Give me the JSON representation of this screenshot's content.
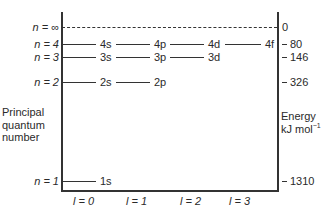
{
  "diagram": {
    "title": "",
    "left_axis_label": [
      "Principal",
      "quantum",
      "number"
    ],
    "right_axis_label": {
      "line1": "Energy",
      "line2": "kJ mol",
      "sup": "−1"
    },
    "levels": [
      {
        "n_label": "n = ∞",
        "energy": "0",
        "style": "dashed"
      },
      {
        "n_label": "n = 4",
        "energy": "80",
        "orbitals": [
          "4s",
          "4p",
          "4d",
          "4f"
        ]
      },
      {
        "n_label": "n = 3",
        "energy": "146",
        "orbitals": [
          "3s",
          "3p",
          "3d"
        ]
      },
      {
        "n_label": "n = 2",
        "energy": "326",
        "orbitals": [
          "2s",
          "2p"
        ]
      },
      {
        "n_label": "n = 1",
        "energy": "1310",
        "orbitals": [
          "1s"
        ]
      }
    ],
    "x_labels": [
      "l = 0",
      "l = 1",
      "l = 2",
      "l = 3"
    ]
  }
}
